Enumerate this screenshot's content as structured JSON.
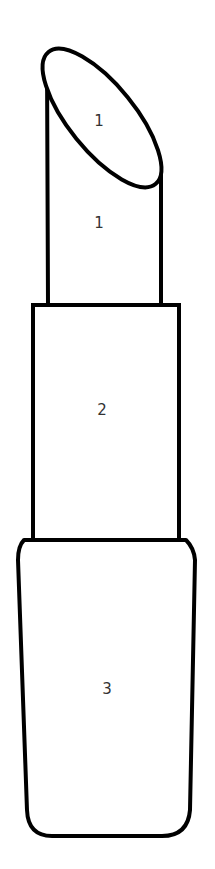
{
  "drawing": {
    "subject": "lipstick",
    "stroke_color": "#000000",
    "fill_color": "#ffffff",
    "label_color": "#333333"
  },
  "regions": [
    {
      "id": "tip-top",
      "label": "1"
    },
    {
      "id": "bullet",
      "label": "1"
    },
    {
      "id": "sleeve",
      "label": "2"
    },
    {
      "id": "case",
      "label": "3"
    }
  ]
}
